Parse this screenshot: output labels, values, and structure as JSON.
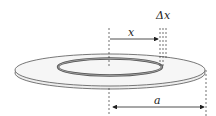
{
  "figure": {
    "labels": {
      "x": "x",
      "delta_x": "Δx",
      "a": "a"
    },
    "colors": {
      "disk_fill": "#f4f4f4",
      "disk_edge": "#555555",
      "ring": "#666666",
      "lines": "#222222"
    }
  }
}
